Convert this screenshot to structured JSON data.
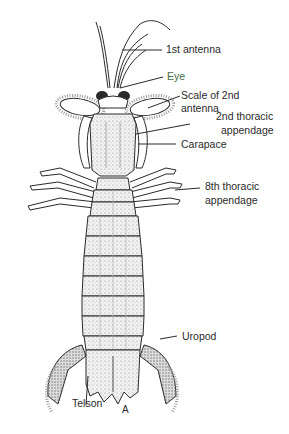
{
  "figure": {
    "caption": "A",
    "labels": [
      {
        "id": "first-antenna",
        "text": "1st antenna"
      },
      {
        "id": "eye",
        "text": "Eye"
      },
      {
        "id": "scale-2nd-antenna-line1",
        "text": "Scale of 2nd"
      },
      {
        "id": "scale-2nd-antenna-line2",
        "text": "antenna"
      },
      {
        "id": "second-thoracic-line1",
        "text": "2nd thoracic"
      },
      {
        "id": "second-thoracic-line2",
        "text": "appendage"
      },
      {
        "id": "carapace",
        "text": "Carapace"
      },
      {
        "id": "eighth-thoracic-line1",
        "text": "8th thoracic"
      },
      {
        "id": "eighth-thoracic-line2",
        "text": "appendage"
      },
      {
        "id": "uropod",
        "text": "Uropod"
      },
      {
        "id": "telson",
        "text": "Telson"
      }
    ],
    "colors": {
      "line": "#2a2a2a",
      "eye_label": "#3f6b4a",
      "body_fill": "#eeeeee",
      "shade": "#9a9a9a"
    }
  }
}
